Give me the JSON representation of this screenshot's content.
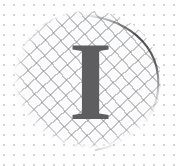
{
  "image": {
    "kind": "illustration",
    "description": "Large serif capital letter over a crosshatched circular patch on dotted paper",
    "width": 178,
    "height": 166,
    "background_color": "#ffffff"
  },
  "background": {
    "pattern": "dot-grid",
    "dot_color": "#96969f",
    "dot_spacing_px": 10,
    "dot_radius_px": 1
  },
  "disc": {
    "name": "hatched-disc",
    "shape": "circle",
    "center_x": 87,
    "center_y": 81,
    "radius_px": 74,
    "fill_color": "#fbfbfc",
    "hatch_color": "#76788 0",
    "hatch_spacing_px": 10,
    "hatch_angle_deg": 48,
    "outline_color": "#4a4a4a",
    "edge_style": "soft-faded-left-and-bottom"
  },
  "letter": {
    "name": "letter-i",
    "character": "I",
    "style": "serif-bold",
    "color": "#5e5e60",
    "font_size_px": 112,
    "center_x": 90,
    "center_y": 80
  }
}
